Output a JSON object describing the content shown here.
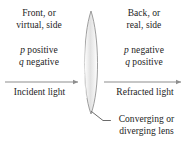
{
  "figure": {
    "width": 187,
    "height": 143,
    "background": "#ffffff"
  },
  "labels": {
    "front_side": {
      "line1": "Front, or",
      "line2": "virtual, side"
    },
    "back_side": {
      "line1": "Back, or",
      "line2": "real, side"
    },
    "left_signs": {
      "line1_var": "p",
      "line1_text": " positive",
      "line2_var": "q",
      "line2_text": " negative"
    },
    "right_signs": {
      "line1_var": "p",
      "line1_text": " negative",
      "line2_var": "q",
      "line2_text": " positive"
    },
    "incident_light": "Incident light",
    "refracted_light": "Refracted light",
    "lens_caption": {
      "line1": "Converging or",
      "line2": "diverging lens"
    }
  },
  "graphics": {
    "lens": {
      "name": "biconvex-lens",
      "center_x": 91,
      "top_y": 11,
      "bottom_y": 114,
      "max_half_width": 9,
      "outline_color": "#8c8c8c",
      "fill_from": "#ffffff",
      "fill_to": "#d8d8d8"
    },
    "incident_arrow": {
      "name": "incident-light-arrow",
      "x1": 5,
      "x2": 79,
      "y": 82,
      "direction": "right",
      "color": "#8e8e8e"
    },
    "refracted_arrow": {
      "name": "refracted-light-arrow",
      "x1": 104,
      "x2": 182,
      "y": 82,
      "direction": "right",
      "color": "#8e8e8e"
    },
    "leader_line": {
      "name": "lens-caption-leader-line",
      "x1": 92,
      "y1": 112,
      "x2": 110,
      "y2": 122,
      "color": "#5a5a5a"
    }
  },
  "colors": {
    "text": "#1c1c1c",
    "arrow": "#8e8e8e",
    "lens_outline": "#8c8c8c",
    "leader": "#5a5a5a"
  }
}
